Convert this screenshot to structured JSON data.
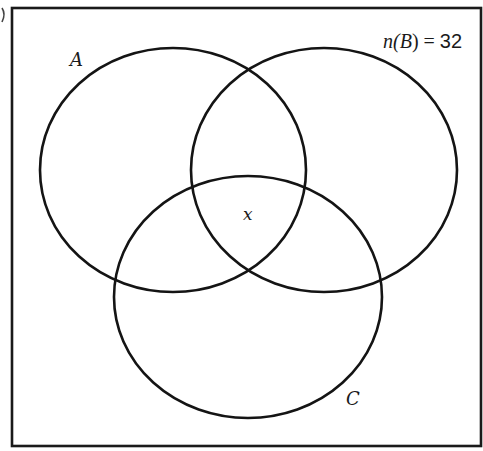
{
  "diagram": {
    "type": "venn",
    "universal_set": {
      "x": 12,
      "y": 8,
      "width": 469,
      "height": 438
    },
    "sets": [
      {
        "id": "A",
        "label": "A",
        "cx": 173,
        "cy": 170,
        "rx": 133,
        "ry": 122,
        "label_x": 70,
        "label_y": 66
      },
      {
        "id": "B",
        "label": "B",
        "cx": 324,
        "cy": 170,
        "rx": 133,
        "ry": 122
      },
      {
        "id": "C",
        "label": "C",
        "cx": 248,
        "cy": 297,
        "rx": 134,
        "ry": 121,
        "label_x": 348,
        "label_y": 405
      }
    ],
    "regions": [
      {
        "id": "A∩B∩C",
        "label": "x",
        "x": 245,
        "y": 220
      }
    ],
    "annotation": {
      "prefix": "n(",
      "set": "B",
      "suffix": ")",
      "equals": " = ",
      "value": "32",
      "x": 383,
      "y": 48
    },
    "stroke_color": "#141414",
    "background": "#ffffff"
  }
}
